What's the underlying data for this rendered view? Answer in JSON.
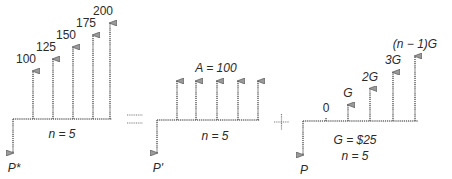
{
  "diagrams": [
    {
      "id": "gradient-series",
      "present_label": "P*",
      "n_label": "n = 5",
      "cash_flows": [
        {
          "label": "100",
          "value": 100
        },
        {
          "label": "125",
          "value": 125
        },
        {
          "label": "150",
          "value": 150
        },
        {
          "label": "175",
          "value": 175
        },
        {
          "label": "200",
          "value": 200
        }
      ]
    },
    {
      "id": "uniform-series",
      "present_label": "P'",
      "n_label": "n = 5",
      "series_label": "A = 100",
      "cash_flows": [
        {
          "value": 100
        },
        {
          "value": 100
        },
        {
          "value": 100
        },
        {
          "value": 100
        },
        {
          "value": 100
        }
      ]
    },
    {
      "id": "linear-gradient",
      "present_label": "P",
      "n_label": "n = 5",
      "g_label": "G = $25",
      "cash_flows": [
        {
          "label": "0",
          "value": 0
        },
        {
          "label": "G",
          "value": 25
        },
        {
          "label": "2G",
          "value": 50
        },
        {
          "label": "3G",
          "value": 75
        },
        {
          "label": "(n − 1)G",
          "value": 100
        }
      ]
    }
  ],
  "operators": {
    "equals": "=",
    "plus": "+"
  }
}
